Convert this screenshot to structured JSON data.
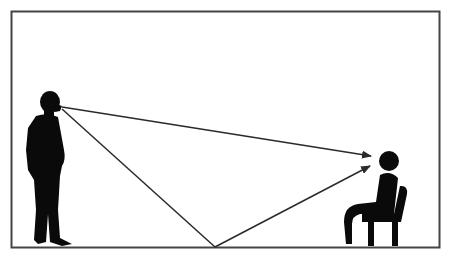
{
  "diagram": {
    "colors": {
      "frame": "#333333",
      "figure": "#0a0a0a",
      "line": "#2a2a2a",
      "background": "#ffffff"
    },
    "nodes": [
      {
        "id": "standing-person",
        "label": ""
      },
      {
        "id": "seated-person",
        "label": ""
      },
      {
        "id": "floor-reflection-point",
        "label": ""
      }
    ],
    "edges": [
      {
        "from": "standing-person",
        "to": "seated-person",
        "type": "arrow"
      },
      {
        "from": "standing-person",
        "to": "floor-reflection-point",
        "type": "line"
      },
      {
        "from": "floor-reflection-point",
        "to": "seated-person",
        "type": "arrow"
      }
    ]
  }
}
